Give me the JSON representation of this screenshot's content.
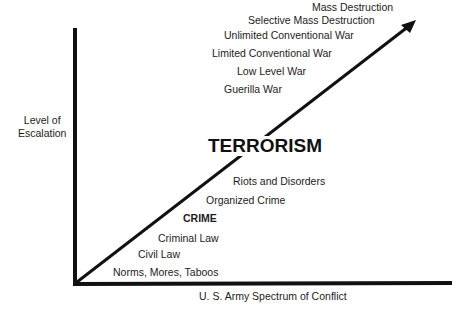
{
  "diagram": {
    "title": "U. S. Army Spectrum of Conflict",
    "y_axis_label": [
      "Level of",
      "Escalation"
    ],
    "x_axis_label": "U. S. Army Spectrum of Conflict",
    "levels": [
      {
        "label": "Norms, Mores, Taboos",
        "emphasis": "normal"
      },
      {
        "label": "Civil Law",
        "emphasis": "normal"
      },
      {
        "label": "Criminal Law",
        "emphasis": "normal"
      },
      {
        "label": "CRIME",
        "emphasis": "bold"
      },
      {
        "label": "Organized Crime",
        "emphasis": "normal"
      },
      {
        "label": "Riots and Disorders",
        "emphasis": "normal"
      },
      {
        "label": "TERRORISM",
        "emphasis": "large-bold"
      },
      {
        "label": "Guerilla War",
        "emphasis": "normal"
      },
      {
        "label": "Low Level War",
        "emphasis": "normal"
      },
      {
        "label": "Limited Conventional War",
        "emphasis": "normal"
      },
      {
        "label": "Unlimited Conventional War",
        "emphasis": "normal"
      },
      {
        "label": "Selective Mass Destruction",
        "emphasis": "normal"
      },
      {
        "label": "Mass Destruction",
        "emphasis": "normal"
      }
    ],
    "colors": {
      "line": "#111111",
      "text": "#1c1c1c",
      "background": "#ffffff"
    }
  }
}
